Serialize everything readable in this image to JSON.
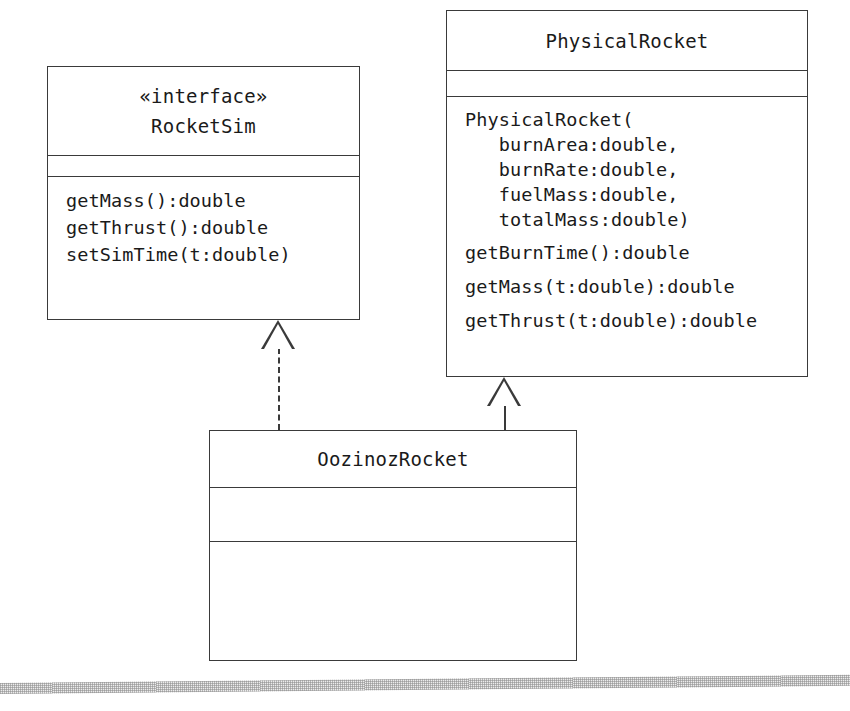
{
  "diagram": {
    "type": "uml-class-diagram",
    "background_color": "#ffffff",
    "line_color": "#3a3a3a",
    "classes": [
      {
        "id": "rocketsim",
        "name": "RocketSim",
        "stereotype": "«interface»",
        "attributes": [],
        "operations": [
          "getMass():double",
          "getThrust():double",
          "setSimTime(t:double)"
        ]
      },
      {
        "id": "physicalrocket",
        "name": "PhysicalRocket",
        "stereotype": "",
        "attributes": [],
        "operations": [
          "PhysicalRocket(",
          "   burnArea:double,",
          "   burnRate:double,",
          "   fuelMass:double,",
          "   totalMass:double)",
          "getBurnTime():double",
          "getMass(t:double):double",
          "getThrust(t:double):double"
        ]
      },
      {
        "id": "oozinozrocket",
        "name": "OozinozRocket",
        "stereotype": "",
        "attributes": [],
        "operations": []
      }
    ],
    "relationships": [
      {
        "id": "realization",
        "kind": "realization",
        "line_style": "dashed",
        "arrowhead": "hollow-triangle",
        "source": "OozinozRocket",
        "target": "RocketSim"
      },
      {
        "id": "generalization",
        "kind": "generalization",
        "line_style": "solid",
        "arrowhead": "hollow-triangle",
        "source": "OozinozRocket",
        "target": "PhysicalRocket"
      }
    ]
  }
}
